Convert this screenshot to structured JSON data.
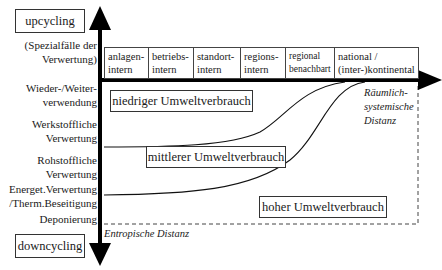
{
  "diagram": {
    "top_label": "upcycling",
    "bottom_label": "downcycling",
    "y_axis_levels": [
      {
        "line1": "(Spezialfälle der",
        "line2": "Verwertung)"
      },
      {
        "line1": "Wieder-/Weiter-",
        "line2": "verwendung"
      },
      {
        "line1": "Werkstoffliche",
        "line2": "Verwertung"
      },
      {
        "line1": "Rohstoffliche",
        "line2": "Verwertung"
      },
      {
        "line1": "Energet.Verwertung",
        "line2": "/Therm.Beseitigung"
      },
      {
        "line1": "Deponierung",
        "line2": ""
      }
    ],
    "x_axis_categories": [
      {
        "line1": "anlagen-",
        "line2": "intern"
      },
      {
        "line1": "betriebs-",
        "line2": "intern"
      },
      {
        "line1": "standort-",
        "line2": "intern"
      },
      {
        "line1": "regions-",
        "line2": "intern"
      },
      {
        "line1": "regional",
        "line2": "benachbart"
      },
      {
        "line1": "national /",
        "line2": "(inter-)kontinental"
      }
    ],
    "x_axis_title": {
      "line1": "Räumlich-",
      "line2": "systemische",
      "line3": "Distanz"
    },
    "y_axis_title": "Entropische Distanz",
    "regions": {
      "low": "niedriger Umweltverbrauch",
      "medium": "mittlerer Umweltverbrauch",
      "high": "hoher Umweltverbrauch"
    },
    "colors": {
      "line": "#111111",
      "box_border": "#333333",
      "background": "#ffffff"
    }
  }
}
